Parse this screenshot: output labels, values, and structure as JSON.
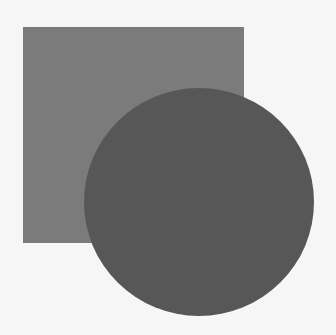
{
  "diagram": {
    "background_color": "#f6f6f6",
    "shapes": [
      {
        "type": "square",
        "color": "#7b7b7b",
        "x": 23,
        "y": 27,
        "width": 221,
        "height": 216
      },
      {
        "type": "circle",
        "color": "#575757",
        "cx": 199,
        "cy": 202,
        "diameter": 230
      }
    ]
  }
}
